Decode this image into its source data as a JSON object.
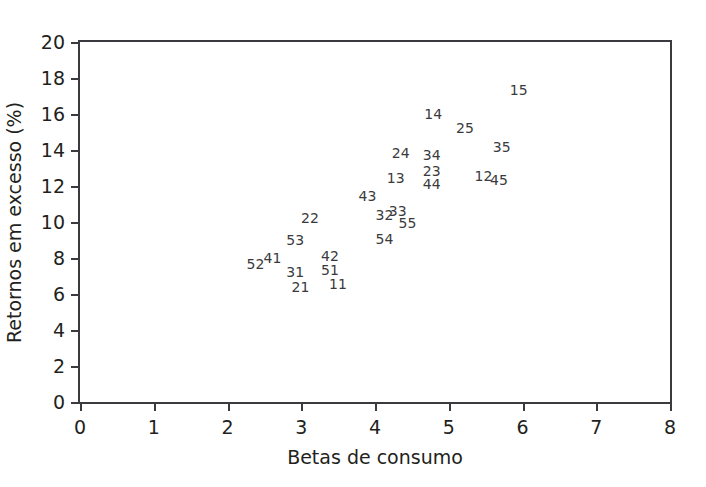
{
  "chart_data": {
    "type": "scatter",
    "title": "",
    "xlabel": "Betas de consumo",
    "ylabel": "Retornos em excesso (%)",
    "xlim": [
      0,
      8
    ],
    "ylim": [
      0,
      20
    ],
    "xticks": [
      "0",
      "1",
      "2",
      "3",
      "4",
      "5",
      "6",
      "7",
      "8"
    ],
    "yticks": [
      "0",
      "2",
      "4",
      "6",
      "8",
      "10",
      "12",
      "14",
      "16",
      "18",
      "20"
    ],
    "grid": false,
    "legend": null,
    "marker_style": "text-label-only",
    "points": [
      {
        "label": "52",
        "x": 2.38,
        "y": 7.69
      },
      {
        "label": "41",
        "x": 2.61,
        "y": 8.02
      },
      {
        "label": "53",
        "x": 2.92,
        "y": 9.01
      },
      {
        "label": "31",
        "x": 2.92,
        "y": 7.25
      },
      {
        "label": "21",
        "x": 2.99,
        "y": 6.37
      },
      {
        "label": "22",
        "x": 3.12,
        "y": 10.22
      },
      {
        "label": "42",
        "x": 3.39,
        "y": 8.13
      },
      {
        "label": "51",
        "x": 3.39,
        "y": 7.36
      },
      {
        "label": "11",
        "x": 3.5,
        "y": 6.54
      },
      {
        "label": "43",
        "x": 3.9,
        "y": 11.43
      },
      {
        "label": "32",
        "x": 4.13,
        "y": 10.38
      },
      {
        "label": "33",
        "x": 4.31,
        "y": 10.6
      },
      {
        "label": "55",
        "x": 4.44,
        "y": 9.95
      },
      {
        "label": "54",
        "x": 4.13,
        "y": 9.07
      },
      {
        "label": "24",
        "x": 4.35,
        "y": 13.85
      },
      {
        "label": "13",
        "x": 4.28,
        "y": 12.42
      },
      {
        "label": "34",
        "x": 4.77,
        "y": 13.74
      },
      {
        "label": "23",
        "x": 4.77,
        "y": 12.86
      },
      {
        "label": "44",
        "x": 4.77,
        "y": 12.09
      },
      {
        "label": "14",
        "x": 4.79,
        "y": 15.99
      },
      {
        "label": "25",
        "x": 5.22,
        "y": 15.22
      },
      {
        "label": "35",
        "x": 5.72,
        "y": 14.18
      },
      {
        "label": "12",
        "x": 5.47,
        "y": 12.58
      },
      {
        "label": "45",
        "x": 5.68,
        "y": 12.36
      },
      {
        "label": "15",
        "x": 5.95,
        "y": 17.36
      }
    ]
  },
  "colors": {
    "axis": "#3b3b3f",
    "text": "#231f20",
    "point_label": "#3a3a3c",
    "background": "#ffffff"
  }
}
